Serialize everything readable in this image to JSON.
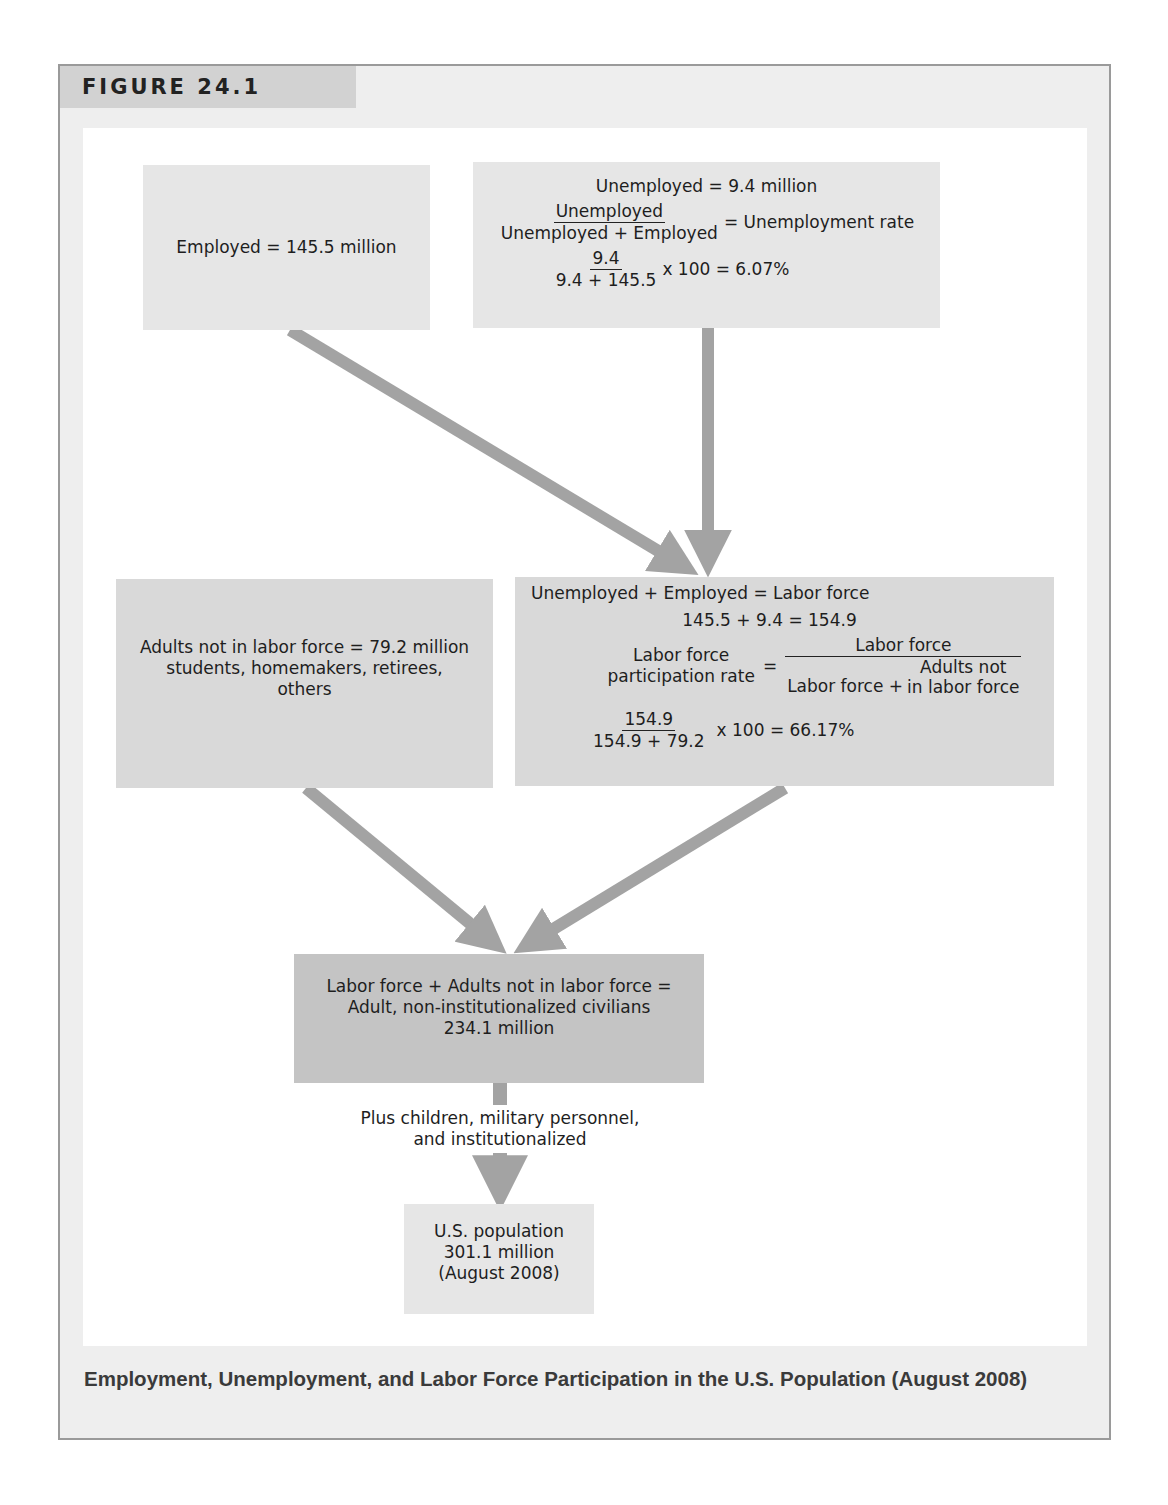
{
  "figure": {
    "label": "FIGURE 24.1",
    "caption": "Employment, Unemployment, and Labor Force Participation in the U.S. Population (August 2008)"
  },
  "boxes": {
    "employed": {
      "text": "Employed = 145.5 million"
    },
    "unemployed": {
      "title": "Unemployed = 9.4 million",
      "formula_num": "Unemployed",
      "formula_den": "Unemployed + Employed",
      "formula_result": "= Unemployment rate",
      "calc_num": "9.4",
      "calc_den": "9.4 + 145.5",
      "calc_result": "x 100 = 6.07%"
    },
    "not_in_labor_force": {
      "line1": "Adults not in labor force = 79.2 million",
      "line2": "students, homemakers, retirees,",
      "line3": "others"
    },
    "labor_force": {
      "title": "Unemployed + Employed = Labor force",
      "sum": "145.5 + 9.4 = 154.9",
      "rate_label_line1": "Labor force",
      "rate_label_line2": "participation rate",
      "equals": "=",
      "rate_num": "Labor force",
      "rate_den_left": "Labor force +",
      "rate_den_right_line1": "Adults not",
      "rate_den_right_line2": "in labor force",
      "calc_num": "154.9",
      "calc_den": "154.9 + 79.2",
      "calc_result": "x 100 = 66.17%"
    },
    "civilians": {
      "line1": "Labor force + Adults not in labor force =",
      "line2": "Adult, non-institutionalized civilians",
      "line3": "234.1 million"
    },
    "note": {
      "line1": "Plus children, military personnel,",
      "line2": "and institutionalized"
    },
    "population": {
      "line1": "U.S. population",
      "line2": "301.1 million",
      "line3": "(August 2008)"
    }
  },
  "colors": {
    "frame_bg": "#eeeeee",
    "frame_border": "#9a9a9a",
    "tab_bg": "#d2d2d2",
    "box_light": "#e6e6e6",
    "box_mid": "#d9d9d9",
    "box_dark": "#c4c4c4",
    "arrow": "#a3a3a3"
  }
}
